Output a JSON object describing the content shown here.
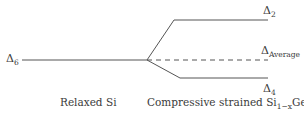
{
  "diagram": {
    "type": "energy-level-splitting",
    "levels": {
      "relaxed": {
        "symbol": "Δ",
        "subscript": "6"
      },
      "upper": {
        "symbol": "Δ",
        "subscript": "2"
      },
      "average": {
        "symbol": "Δ",
        "subscript": "Average"
      },
      "lower": {
        "symbol": "Δ",
        "subscript": "4"
      }
    },
    "captions": {
      "left": "Relaxed Si",
      "right_prefix": "Compressive strained Si",
      "right_sub1": "1−x",
      "right_mid": "Ge",
      "right_sub2": "x"
    },
    "colors": {
      "line": "#555555",
      "text": "#3a3a3a"
    }
  }
}
